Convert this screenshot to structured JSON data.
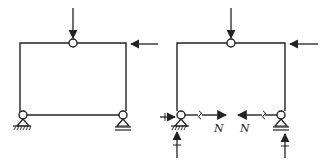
{
  "figure": {
    "left_frame": {
      "name": "original-structure",
      "loads": [
        "vertical-load-at-crown",
        "horizontal-load-at-right-top"
      ]
    },
    "right_frame": {
      "name": "free-body-with-tie-cut",
      "tie_force_label_left": "N",
      "tie_force_label_right": "N",
      "loads": [
        "vertical-load-at-crown",
        "horizontal-load-at-right-top",
        "horizontal-reaction-left",
        "vertical-reaction-left",
        "vertical-reaction-right"
      ]
    },
    "colors": {
      "line": "#222222",
      "background": "#ffffff"
    }
  }
}
